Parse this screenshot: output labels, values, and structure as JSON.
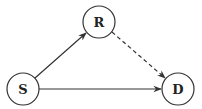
{
  "diagram": {
    "type": "directed-graph",
    "nodes": [
      {
        "id": "S",
        "label": "S",
        "cx": 23,
        "cy": 89,
        "r": 16
      },
      {
        "id": "R",
        "label": "R",
        "cx": 99,
        "cy": 22,
        "r": 16
      },
      {
        "id": "D",
        "label": "D",
        "cx": 178,
        "cy": 89,
        "r": 16
      }
    ],
    "edges": [
      {
        "from": "S",
        "to": "R",
        "style": "solid"
      },
      {
        "from": "S",
        "to": "D",
        "style": "solid"
      },
      {
        "from": "R",
        "to": "D",
        "style": "dashed"
      }
    ],
    "colors": {
      "stroke": "#333333",
      "background": "#ffffff"
    }
  }
}
